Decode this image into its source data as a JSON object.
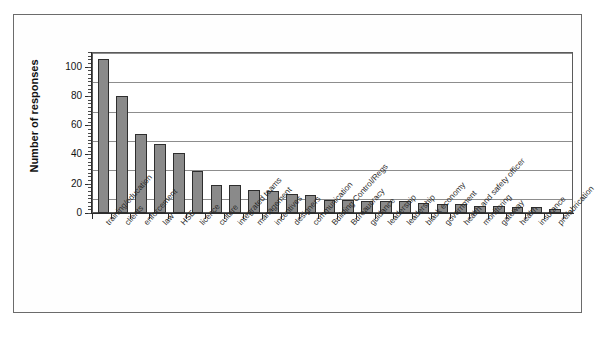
{
  "figure": {
    "y_axis_title": "Number of responses",
    "border_color": "#6b6b6b",
    "bar_fill": "#8a8a8a",
    "bar_stroke": "#2e2e2e",
    "grid_color": "#8d8d8d",
    "axis_color": "#2b2b2b"
  },
  "chart_data": {
    "type": "bar",
    "title": "",
    "xlabel": "",
    "ylabel": "Number of responses",
    "ylim": [
      0,
      110
    ],
    "yticks": [
      0,
      20,
      40,
      60,
      80,
      100
    ],
    "ytick_labels": [
      "0",
      "20",
      "40",
      "60",
      "80",
      "100"
    ],
    "grid": true,
    "legend": "none",
    "orientation": "vertical",
    "categories": [
      "training/education",
      "clients",
      "enforcement",
      "law",
      "HSE",
      "licence",
      "culture",
      "integrated teams",
      "management",
      "incentives",
      "designers",
      "communication",
      "Building Control/Regs",
      "Bureaucracy",
      "guidance",
      "leadership",
      "leadership",
      "black economy",
      "government",
      "health and safety officer",
      "monitoring",
      "gateway",
      "health",
      "insurance",
      "prefabrication"
    ],
    "values": [
      105,
      80,
      54,
      47,
      41,
      29,
      19,
      19,
      16,
      15,
      13,
      12,
      9,
      9,
      8,
      8,
      8,
      7,
      6,
      6,
      5,
      5,
      4,
      4,
      3
    ]
  }
}
